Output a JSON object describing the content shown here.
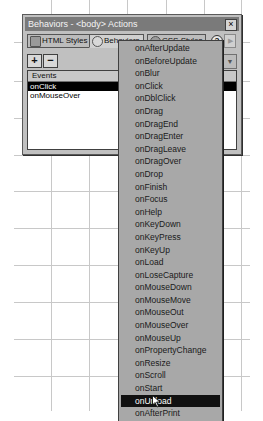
{
  "window": {
    "title": "Behaviors - <body> Actions",
    "close_label": "×"
  },
  "tabs": [
    {
      "label": "HTML Styles",
      "icon": "html-styles-icon",
      "active": false
    },
    {
      "label": "Behaviors",
      "icon": "gear-icon",
      "active": true
    },
    {
      "label": "CSS Styles",
      "icon": "css-styles-icon",
      "active": false
    }
  ],
  "toolbar": {
    "help_label": "?",
    "arrow_label": "▶",
    "add_label": "+",
    "remove_label": "−",
    "dropdown_label": "▼"
  },
  "events_list": {
    "header": "Events",
    "rows": [
      {
        "label": "onClick",
        "selected": true
      },
      {
        "label": "onMouseOver",
        "selected": false
      }
    ]
  },
  "event_menu": {
    "items": [
      "onAfterUpdate",
      "onBeforeUpdate",
      "onBlur",
      "onClick",
      "onDblClick",
      "onDrag",
      "onDragEnd",
      "onDragEnter",
      "onDragLeave",
      "onDragOver",
      "onDrop",
      "onFinish",
      "onFocus",
      "onHelp",
      "onKeyDown",
      "onKeyPress",
      "onKeyUp",
      "onLoad",
      "onLoseCapture",
      "onMouseDown",
      "onMouseMove",
      "onMouseOut",
      "onMouseOver",
      "onMouseUp",
      "onPropertyChange",
      "onResize",
      "onScroll",
      "onStart",
      "onUnload",
      "onAfterPrint"
    ],
    "highlighted": "onUnload"
  },
  "colors": {
    "panel_bg": "#c0c0c0",
    "titlebar_bg": "#7a7a7a",
    "menu_bg": "#a8a8a8",
    "selection_bg": "#000000",
    "grid_line": "#c8c8c8"
  }
}
